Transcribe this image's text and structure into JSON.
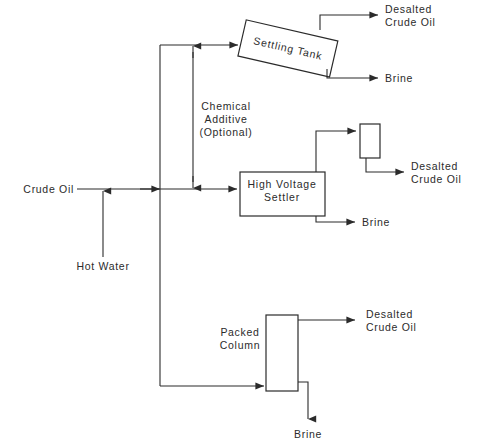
{
  "diagram": {
    "colors": {
      "background": "#ffffff",
      "line": "#2b2b2b",
      "text": "#2b2b2b"
    },
    "inputs": {
      "crude_oil": "Crude Oil",
      "hot_water": "Hot Water",
      "chemical_additive_line1": "Chemical",
      "chemical_additive_line2": "Additive",
      "chemical_additive_line3": "(Optional)"
    },
    "units": {
      "settling_tank": "Settling Tank",
      "high_voltage_settler_line1": "High Voltage",
      "high_voltage_settler_line2": "Settler",
      "packed_column_line1": "Packed",
      "packed_column_line2": "Column",
      "surge_vessel": ""
    },
    "outputs": {
      "top_desalted_line1": "Desalted",
      "top_desalted_line2": "Crude Oil",
      "top_brine": "Brine",
      "middle_desalted_line1": "Desalted",
      "middle_desalted_line2": "Crude Oil",
      "middle_brine": "Brine",
      "bottom_desalted_line1": "Desalted",
      "bottom_desalted_line2": "Crude Oil",
      "bottom_brine": "Brine"
    }
  }
}
